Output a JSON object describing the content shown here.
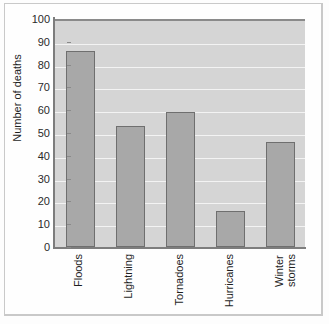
{
  "chart_data": {
    "type": "bar",
    "title": "",
    "subtitle": "",
    "xlabel": "",
    "ylabel": "Number of deaths",
    "categories": [
      "Floods",
      "Lightning",
      "Tornadoes",
      "Hurricanes",
      "Winter\nstorms"
    ],
    "values": [
      86,
      53,
      59,
      16,
      46
    ],
    "ylim": [
      0,
      100
    ],
    "ytick_labels": [
      "0",
      "10",
      "20",
      "30",
      "40",
      "50",
      "60",
      "70",
      "80",
      "90",
      "100"
    ],
    "ytick_values": [
      0,
      10,
      20,
      30,
      40,
      50,
      60,
      70,
      80,
      90,
      100
    ],
    "grid": "horizontal",
    "legend": "none",
    "colors": {
      "bar_fill": "#a8a8a8",
      "bar_edge": "#6f6f6f",
      "plot_background": "#d5d5d5",
      "gridline": "#f3f3f3",
      "axis": "#7d7d7d",
      "text": "#1f1f1f",
      "figure_background": "#fefefe",
      "frame_border": "#c9c9c9"
    }
  }
}
